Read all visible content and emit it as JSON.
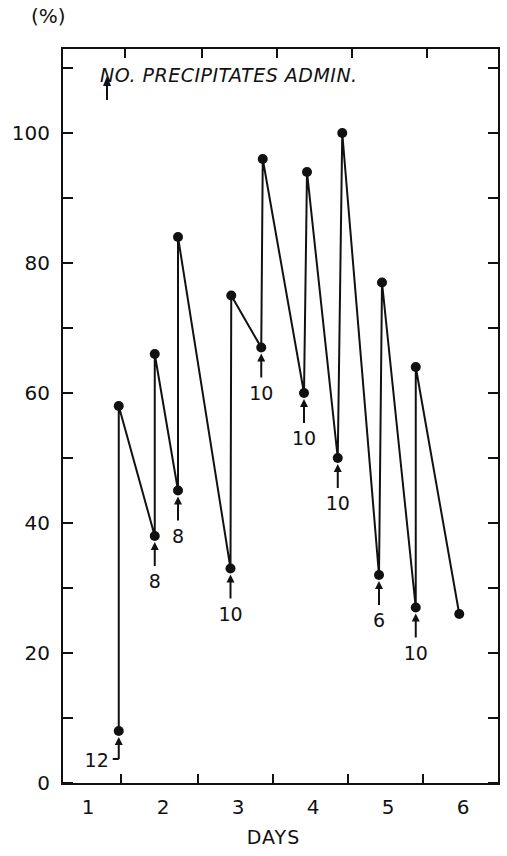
{
  "chart_data": {
    "type": "line",
    "title": "",
    "ylabel": "(%)",
    "xlabel": "DAYS",
    "ylim": [
      0,
      110
    ],
    "yticks_labeled": [
      0,
      20,
      40,
      60,
      80,
      100
    ],
    "yticks_minor": [
      10,
      30,
      50,
      70,
      90,
      110
    ],
    "x_tick_labels": [
      "1",
      "2",
      "3",
      "4",
      "5",
      "6"
    ],
    "xlim": [
      0.55,
      6.5
    ],
    "grid": false,
    "legend": {
      "symbol": "arrow-up",
      "text": "NO. PRECIPITATES ADMIN.",
      "position": "top-left"
    },
    "series": [
      {
        "name": "percent",
        "points": [
          {
            "x": 1.41,
            "y": 8,
            "annotation": "12"
          },
          {
            "x": 1.41,
            "y": 58
          },
          {
            "x": 1.89,
            "y": 38,
            "annotation": "8"
          },
          {
            "x": 1.89,
            "y": 66
          },
          {
            "x": 2.2,
            "y": 45,
            "annotation": "8"
          },
          {
            "x": 2.2,
            "y": 84
          },
          {
            "x": 2.9,
            "y": 33,
            "annotation": "10"
          },
          {
            "x": 2.91,
            "y": 75
          },
          {
            "x": 3.31,
            "y": 67,
            "annotation": "10"
          },
          {
            "x": 3.33,
            "y": 96
          },
          {
            "x": 3.88,
            "y": 60,
            "annotation": "10"
          },
          {
            "x": 3.92,
            "y": 94
          },
          {
            "x": 4.33,
            "y": 50,
            "annotation": "10"
          },
          {
            "x": 4.39,
            "y": 100
          },
          {
            "x": 4.88,
            "y": 32,
            "annotation": "6"
          },
          {
            "x": 4.92,
            "y": 77
          },
          {
            "x": 5.37,
            "y": 27,
            "annotation": "10"
          },
          {
            "x": 5.37,
            "y": 64
          },
          {
            "x": 5.95,
            "y": 26
          }
        ]
      }
    ]
  },
  "labels": {
    "unit": "(%)",
    "xlabel": "DAYS",
    "legend_text": "NO. PRECIPITATES ADMIN."
  }
}
